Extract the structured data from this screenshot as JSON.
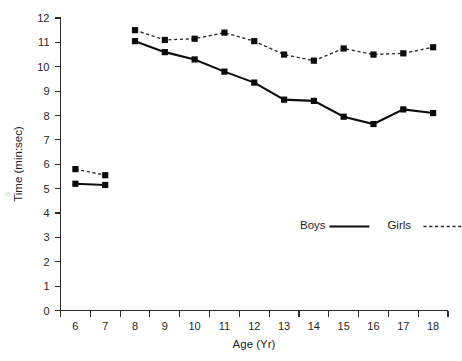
{
  "chart_data": {
    "type": "line",
    "title": "",
    "subtitle": "",
    "xlabel": "Age (Yr)",
    "ylabel": "Time (min:sec)",
    "x": [
      6,
      7,
      8,
      9,
      10,
      11,
      12,
      13,
      14,
      15,
      16,
      17,
      18
    ],
    "categories": [
      "6",
      "7",
      "8",
      "9",
      "10",
      "11",
      "12",
      "13",
      "14",
      "15",
      "16",
      "17",
      "18"
    ],
    "xlim": [
      5.5,
      18.5
    ],
    "ylim": [
      0,
      12
    ],
    "xticks": [
      "6",
      "7",
      "8",
      "9",
      "10",
      "11",
      "12",
      "13",
      "14",
      "15",
      "16",
      "17",
      "18"
    ],
    "yticks": [
      "0",
      "1",
      "2",
      "3",
      "4",
      "5",
      "6",
      "7",
      "8",
      "9",
      "10",
      "11",
      "12"
    ],
    "grid": false,
    "legend_position": "inside-lower-right",
    "series": [
      {
        "name": "Boys",
        "style": "solid",
        "marker": "square",
        "color": "#0d0d0d",
        "x": [
          6,
          7,
          8,
          9,
          10,
          11,
          12,
          13,
          14,
          15,
          16,
          17,
          18
        ],
        "values": [
          5.2,
          5.15,
          11.05,
          10.6,
          10.3,
          9.8,
          9.35,
          8.65,
          8.6,
          7.95,
          7.65,
          8.25,
          8.1
        ],
        "segments": [
          [
            6,
            7
          ],
          [
            8,
            9,
            10,
            11,
            12,
            13,
            14,
            15,
            16,
            17,
            18
          ]
        ]
      },
      {
        "name": "Girls",
        "style": "dotted",
        "marker": "square",
        "color": "#2a2a2a",
        "x": [
          6,
          7,
          8,
          9,
          10,
          11,
          12,
          13,
          14,
          15,
          16,
          17,
          18
        ],
        "values": [
          5.8,
          5.55,
          11.5,
          11.1,
          11.15,
          11.4,
          11.05,
          10.5,
          10.25,
          10.75,
          10.5,
          10.55,
          10.8
        ],
        "segments": [
          [
            6,
            7
          ],
          [
            8,
            9,
            10,
            11,
            12,
            13,
            14,
            15,
            16,
            17,
            18
          ]
        ]
      }
    ]
  },
  "legend": {
    "entries": [
      {
        "label": "Boys",
        "style": "solid"
      },
      {
        "label": "Girls",
        "style": "dotted"
      }
    ]
  },
  "axes": {
    "y_title": "Time (min:sec)",
    "x_title": "Age (Yr)"
  },
  "artifact": {
    "edge_text": "s"
  }
}
